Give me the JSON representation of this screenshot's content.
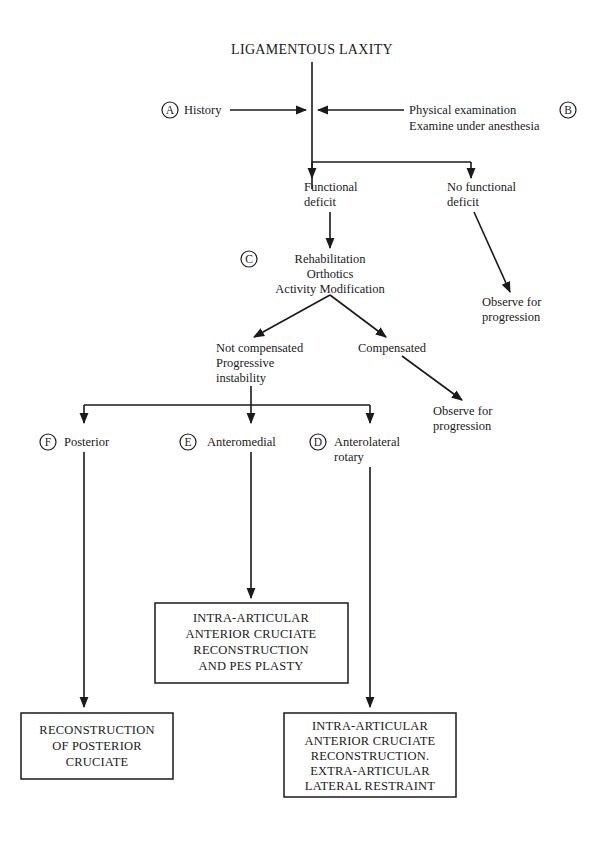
{
  "title": "LIGAMENTOUS LAXITY",
  "nodes": {
    "history": {
      "marker": "A",
      "label": "History"
    },
    "exam": {
      "marker": "B",
      "lines": [
        "Physical examination",
        "Examine under anesthesia"
      ]
    },
    "functional_deficit": {
      "lines": [
        "Functional",
        "deficit"
      ]
    },
    "no_functional_deficit": {
      "lines": [
        "No functional",
        "deficit"
      ]
    },
    "observe_1": {
      "lines": [
        "Observe for",
        "progression"
      ]
    },
    "rehab": {
      "marker": "C",
      "lines": [
        "Rehabilitation",
        "Orthotics",
        "Activity Modification"
      ]
    },
    "not_compensated": {
      "lines": [
        "Not compensated",
        "Progressive",
        "instability"
      ]
    },
    "compensated": {
      "label": "Compensated"
    },
    "observe_2": {
      "lines": [
        "Observe for",
        "progression"
      ]
    },
    "posterior": {
      "marker": "F",
      "label": "Posterior"
    },
    "anteromedial": {
      "marker": "E",
      "label": "Anteromedial"
    },
    "anterolateral": {
      "marker": "D",
      "lines": [
        "Anterolateral",
        "rotary"
      ]
    },
    "box_anteromedial": {
      "lines": [
        "INTRA-ARTICULAR",
        "ANTERIOR CRUCIATE",
        "RECONSTRUCTION",
        "AND PES PLASTY"
      ]
    },
    "box_posterior": {
      "lines": [
        "RECONSTRUCTION",
        "OF POSTERIOR",
        "CRUCIATE"
      ]
    },
    "box_anterolateral": {
      "lines": [
        "INTRA-ARTICULAR",
        "ANTERIOR CRUCIATE",
        "RECONSTRUCTION.",
        "EXTRA-ARTICULAR",
        "LATERAL RESTRAINT"
      ]
    }
  },
  "colors": {
    "ink": "#1a1a1a",
    "background": "#ffffff"
  }
}
